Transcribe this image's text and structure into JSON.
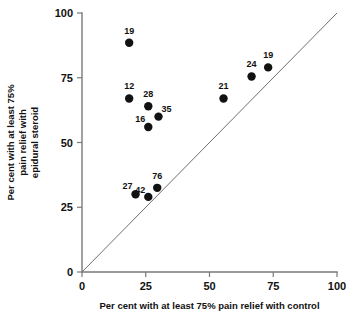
{
  "chart_data": {
    "type": "scatter",
    "title": "",
    "xlabel": "Per cent with at least 75% pain relief with control",
    "ylabel_lines": [
      "Per cent with at least 75%",
      "pain relief with",
      "epidural steroid"
    ],
    "ylabel": "Per cent with at least 75% pain relief with epidural steroid",
    "xlim": [
      0,
      100
    ],
    "ylim": [
      0,
      100
    ],
    "xticks": [
      0,
      25,
      50,
      75,
      100
    ],
    "yticks": [
      0,
      25,
      50,
      75,
      100
    ],
    "xticklabels": [
      "0",
      "25",
      "50",
      "75",
      "100"
    ],
    "yticklabels": [
      "0",
      "25",
      "50",
      "75",
      "100"
    ],
    "grid": false,
    "legend": "none",
    "reference_line": {
      "name": "line-of-equality",
      "from": [
        0,
        0
      ],
      "to": [
        100,
        100
      ]
    },
    "point_label_meaning": "number of patients in trial",
    "points": [
      {
        "label": "19",
        "x": 18.5,
        "y": 88.5,
        "label_dx": 0,
        "label_dy": -9
      },
      {
        "label": "12",
        "x": 18.5,
        "y": 67.0,
        "label_dx": 0,
        "label_dy": -9
      },
      {
        "label": "28",
        "x": 26.0,
        "y": 64.0,
        "label_dx": 0,
        "label_dy": -9
      },
      {
        "label": "35",
        "x": 30.0,
        "y": 60.0,
        "label_dx": 8,
        "label_dy": -5
      },
      {
        "label": "16",
        "x": 26.0,
        "y": 56.0,
        "label_dx": -8,
        "label_dy": -5
      },
      {
        "label": "21",
        "x": 55.5,
        "y": 67.0,
        "label_dx": 0,
        "label_dy": -9
      },
      {
        "label": "24",
        "x": 66.5,
        "y": 75.5,
        "label_dx": 0,
        "label_dy": -9
      },
      {
        "label": "19",
        "x": 73.0,
        "y": 79.0,
        "label_dx": 0,
        "label_dy": -9
      },
      {
        "label": "27",
        "x": 21.0,
        "y": 30.0,
        "label_dx": -8,
        "label_dy": -5
      },
      {
        "label": "42",
        "x": 26.0,
        "y": 29.0,
        "label_dx": -8,
        "label_dy": -4
      },
      {
        "label": "76",
        "x": 29.5,
        "y": 32.5,
        "label_dx": 0,
        "label_dy": -9
      }
    ]
  },
  "colors": {
    "marker": "#121212",
    "axis": "#7a7a7a",
    "line": "#6f6f6f",
    "text": "#111111",
    "background": "#ffffff"
  }
}
